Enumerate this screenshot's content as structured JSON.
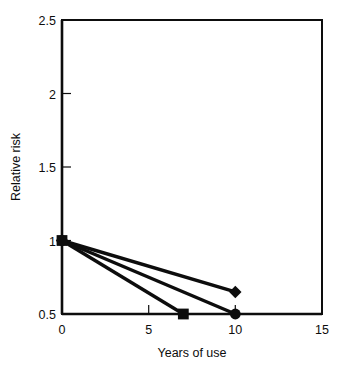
{
  "chart_data": {
    "type": "line",
    "title": "",
    "subtitle": "",
    "xlabel": "Years of use",
    "ylabel": "Relative risk",
    "xlim": [
      0,
      15
    ],
    "ylim": [
      0.5,
      2.5
    ],
    "grid": false,
    "legend_position": "none",
    "x_ticks": [
      0,
      5,
      10,
      15
    ],
    "x_tick_labels": [
      "0",
      "5",
      "10",
      "15"
    ],
    "y_ticks": [
      0.5,
      1,
      1.5,
      2,
      2.5
    ],
    "y_tick_labels": [
      "0.5",
      "1",
      "1.5",
      "2",
      "2.5"
    ],
    "series": [
      {
        "name": "series-diamond",
        "marker": "diamond",
        "x": [
          0,
          10
        ],
        "y": [
          1,
          0.65
        ]
      },
      {
        "name": "series-circle",
        "marker": "circle",
        "x": [
          0,
          10
        ],
        "y": [
          1,
          0.5
        ]
      },
      {
        "name": "series-square",
        "marker": "square",
        "x": [
          0,
          7
        ],
        "y": [
          1,
          0.5
        ]
      }
    ],
    "annotations": [],
    "colors": {
      "line": "#0d0d0d",
      "marker": "#0d0d0d",
      "axis": "#0d0d0d",
      "background": "#ffffff"
    }
  }
}
